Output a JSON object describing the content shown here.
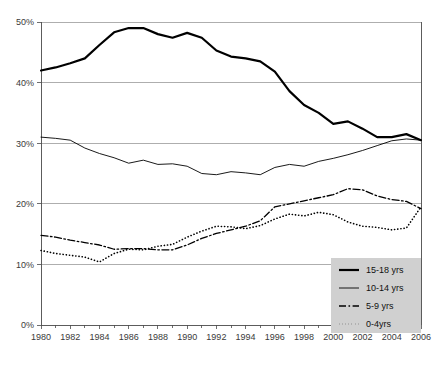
{
  "chart_data": {
    "type": "line",
    "title": "",
    "subtitle": "",
    "xlabel": "",
    "ylabel": "",
    "xlim": [
      1980,
      2006
    ],
    "ylim": [
      0,
      50
    ],
    "grid": true,
    "legend_position": "bottom-right",
    "x": [
      1980,
      1981,
      1982,
      1983,
      1984,
      1985,
      1986,
      1987,
      1988,
      1989,
      1990,
      1991,
      1992,
      1993,
      1994,
      1995,
      1996,
      1997,
      1998,
      1999,
      2000,
      2001,
      2002,
      2003,
      2004,
      2005,
      2006
    ],
    "xtick_labels": [
      "1980",
      "1982",
      "1984",
      "1986",
      "1988",
      "1990",
      "1992",
      "1994",
      "1996",
      "1998",
      "2000",
      "2002",
      "2004",
      "2006"
    ],
    "xtick_values": [
      1980,
      1982,
      1984,
      1986,
      1988,
      1990,
      1992,
      1994,
      1996,
      1998,
      2000,
      2002,
      2004,
      2006
    ],
    "ytick_labels": [
      "0%",
      "10%",
      "20%",
      "30%",
      "40%",
      "50%"
    ],
    "ytick_values": [
      0,
      10,
      20,
      30,
      40,
      50
    ],
    "series": [
      {
        "name": "15-18 yrs",
        "style": "solid-thick",
        "color": "#000000",
        "width": 2.2,
        "dash": "none",
        "values": [
          42.0,
          42.5,
          43.2,
          44.0,
          46.2,
          48.3,
          49.0,
          49.0,
          48.0,
          47.4,
          48.2,
          47.4,
          45.3,
          44.3,
          44.0,
          43.5,
          41.8,
          38.6,
          36.3,
          35.0,
          33.2,
          33.6,
          32.4,
          31.0,
          31.0,
          31.5,
          30.5
        ]
      },
      {
        "name": "10-14 yrs",
        "style": "solid-thin",
        "color": "#000000",
        "width": 0.9,
        "dash": "none",
        "values": [
          31.0,
          30.8,
          30.5,
          29.2,
          28.3,
          27.6,
          26.7,
          27.2,
          26.5,
          26.6,
          26.2,
          25.0,
          24.8,
          25.3,
          25.1,
          24.8,
          26.0,
          26.5,
          26.2,
          27.0,
          27.5,
          28.1,
          28.8,
          29.6,
          30.4,
          30.7,
          30.5
        ]
      },
      {
        "name": "5-9 yrs",
        "style": "dash-dot",
        "color": "#000000",
        "width": 1.3,
        "dash": "7,2.5,1.6,2.5",
        "values": [
          14.8,
          14.5,
          14.0,
          13.6,
          13.2,
          12.5,
          12.6,
          12.6,
          12.4,
          12.4,
          13.2,
          14.3,
          15.1,
          15.7,
          16.3,
          17.2,
          19.5,
          20.0,
          20.5,
          21.0,
          21.5,
          22.5,
          22.3,
          21.3,
          20.7,
          20.4,
          19.2
        ]
      },
      {
        "name": "0-4yrs",
        "style": "dotted",
        "color": "#000000",
        "width": 1.6,
        "dash": "0.2,3.0",
        "values": [
          12.3,
          11.8,
          11.5,
          11.2,
          10.4,
          11.8,
          12.5,
          12.4,
          13.0,
          13.3,
          14.5,
          15.5,
          16.3,
          16.2,
          15.9,
          16.4,
          17.5,
          18.3,
          18.0,
          18.6,
          18.2,
          17.0,
          16.3,
          16.1,
          15.7,
          16.0,
          19.5
        ]
      }
    ]
  },
  "legend": {
    "items": [
      {
        "label": "15-18 yrs"
      },
      {
        "label": "10-14 yrs"
      },
      {
        "label": "5-9 yrs"
      },
      {
        "label": "0-4yrs"
      }
    ]
  },
  "colors": {
    "background": "#ffffff",
    "grid": "#9a9a9a",
    "axis": "#4a4a4a",
    "series": "#000000",
    "legend_background": "#d0d0d0",
    "tick_text": "#3a3a3a"
  }
}
